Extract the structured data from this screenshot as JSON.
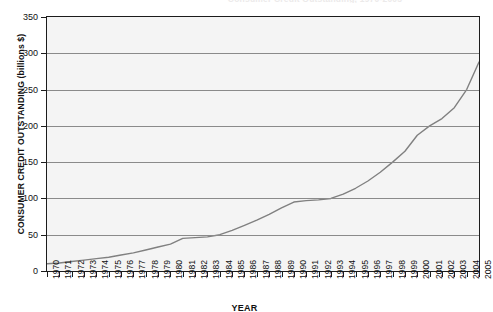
{
  "chart_data": {
    "type": "line",
    "title": "Consumer Credit Outstanding, 1970-2005",
    "xlabel": "YEAR",
    "ylabel": "CONSUMER CREDIT OUTSTANDING (billions $)",
    "ylim": [
      0,
      350
    ],
    "ytick_step": 50,
    "yticks": [
      350,
      300,
      250,
      200,
      150,
      100,
      50,
      0
    ],
    "grid": true,
    "legend": "none",
    "line_color": "#808080",
    "plot_bg": "#f4f4f4",
    "frame_color": "#1c1c1c",
    "categories": [
      "1970",
      "1971",
      "1972",
      "1973",
      "1974",
      "1975",
      "1976",
      "1977",
      "1978",
      "1979",
      "1980",
      "1981",
      "1982",
      "1983",
      "1984",
      "1985",
      "1986",
      "1987",
      "1988",
      "1989",
      "1990",
      "1991",
      "1992",
      "1993",
      "1994",
      "1995",
      "1996",
      "1997",
      "1998",
      "1999",
      "2000",
      "2001",
      "2002",
      "2003",
      "2004",
      "2005"
    ],
    "series": [
      {
        "name": "Consumer credit outstanding",
        "values": [
          10,
          11,
          13,
          15,
          17,
          19,
          22,
          25,
          29,
          33,
          37,
          45,
          46,
          47,
          50,
          56,
          63,
          70,
          78,
          87,
          95,
          97,
          98,
          100,
          106,
          114,
          124,
          136,
          150,
          165,
          187,
          200,
          210,
          225,
          250,
          288
        ]
      }
    ]
  }
}
